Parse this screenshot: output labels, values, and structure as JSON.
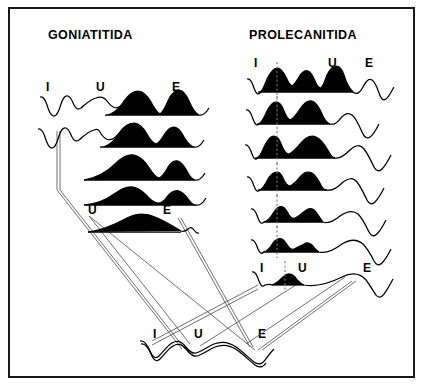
{
  "figure": {
    "type": "diagram",
    "background_color": "#ffffff",
    "ink_color": "#000000",
    "connector_color": "#555555",
    "frame": {
      "stroke": "#1a1a1a",
      "x": 8,
      "y": 7,
      "w": 407,
      "h": 371
    }
  },
  "titles": {
    "left": "GONIATITIDA",
    "right": "PROLECANITIDA"
  },
  "lobe_labels": {
    "internal": "I",
    "umbilical": "U",
    "external": "E"
  },
  "columns": [
    {
      "name": "goniatitida",
      "title": "GONIATITIDA",
      "rows": [
        {
          "index": 1,
          "labels": [
            "I",
            "U",
            "E"
          ],
          "label_row": true,
          "dashed_marker": false
        },
        {
          "index": 2,
          "labels": [],
          "label_row": false,
          "dashed_marker": false
        },
        {
          "index": 3,
          "labels": [],
          "label_row": false,
          "dashed_marker": false
        },
        {
          "index": 4,
          "labels": [],
          "label_row": false,
          "dashed_marker": false
        },
        {
          "index": 5,
          "labels": [
            "U",
            "E"
          ],
          "label_row": true,
          "dashed_marker": false
        }
      ]
    },
    {
      "name": "prolecanitida",
      "title": "PROLECANITIDA",
      "rows": [
        {
          "index": 1,
          "labels": [
            "I",
            "U",
            "E"
          ],
          "label_row": true,
          "dashed_marker": true
        },
        {
          "index": 2,
          "labels": [],
          "label_row": false,
          "dashed_marker": true
        },
        {
          "index": 3,
          "labels": [],
          "label_row": false,
          "dashed_marker": true
        },
        {
          "index": 4,
          "labels": [],
          "label_row": false,
          "dashed_marker": true
        },
        {
          "index": 5,
          "labels": [],
          "label_row": false,
          "dashed_marker": true
        },
        {
          "index": 6,
          "labels": [],
          "label_row": false,
          "dashed_marker": true
        },
        {
          "index": 7,
          "labels": [
            "I",
            "U",
            "E"
          ],
          "label_row": true,
          "dashed_marker": true
        }
      ]
    }
  ],
  "ancestral_suture": {
    "name": "ancestral-suture",
    "labels": [
      "I",
      "U",
      "E"
    ]
  },
  "label_marks": {
    "left_r1_I": "I",
    "left_r1_U": "U",
    "left_r1_E": "E",
    "left_r5_U": "U",
    "left_r5_E": "E",
    "right_r1_I": "I",
    "right_r1_U": "U",
    "right_r1_E": "E",
    "right_r7_I": "I",
    "right_r7_U": "U",
    "right_r7_E": "E",
    "base_I": "I",
    "base_U": "U",
    "base_E": "E"
  }
}
